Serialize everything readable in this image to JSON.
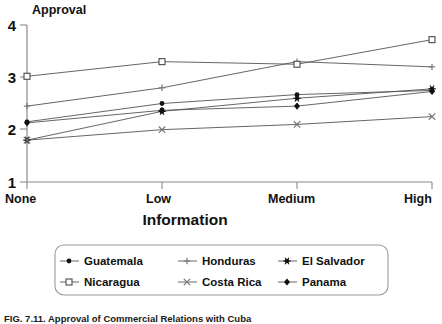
{
  "chart_data": {
    "type": "line",
    "title": "",
    "xlabel": "Information",
    "ylabel": "Approval",
    "categories": [
      "None",
      "Low",
      "Medium",
      "High"
    ],
    "ylim": [
      1,
      4
    ],
    "yticks": [
      "1",
      "2",
      "3",
      "4"
    ],
    "grid": false,
    "legend_position": "bottom",
    "series": [
      {
        "name": "Guatemala",
        "marker": "dot",
        "values": [
          2.15,
          2.5,
          2.67,
          2.75
        ]
      },
      {
        "name": "Honduras",
        "marker": "plus",
        "values": [
          2.45,
          2.8,
          3.3,
          3.2
        ]
      },
      {
        "name": "El Salvador",
        "marker": "asterisk",
        "values": [
          1.8,
          2.35,
          2.6,
          2.78
        ]
      },
      {
        "name": "Nicaragua",
        "marker": "square-open",
        "values": [
          3.02,
          3.3,
          3.25,
          3.72
        ]
      },
      {
        "name": "Costa Rica",
        "marker": "cross",
        "values": [
          1.8,
          2.0,
          2.1,
          2.25
        ]
      },
      {
        "name": "Panama",
        "marker": "diamond",
        "values": [
          2.13,
          2.37,
          2.45,
          2.73
        ]
      }
    ]
  },
  "legend": {
    "entries": [
      {
        "label": "Guatemala",
        "marker": "dot"
      },
      {
        "label": "Honduras",
        "marker": "plus"
      },
      {
        "label": "El Salvador",
        "marker": "asterisk"
      },
      {
        "label": "Nicaragua",
        "marker": "square-open"
      },
      {
        "label": "Costa Rica",
        "marker": "cross"
      },
      {
        "label": "Panama",
        "marker": "diamond"
      }
    ]
  },
  "caption": {
    "text": "FIG. 7.11.   Approval of Commercial Relations with Cuba"
  },
  "colors": {
    "line": "#555555",
    "marker": "#111111",
    "axis": "#8a8a8a",
    "text": "#111111",
    "background": "#ffffff"
  }
}
